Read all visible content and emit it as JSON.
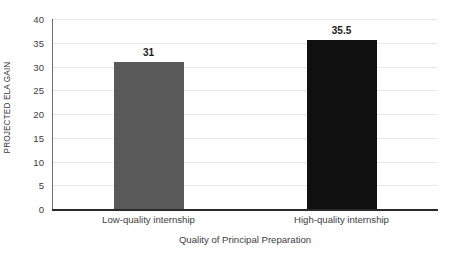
{
  "chart_data": {
    "type": "bar",
    "title": "",
    "subtitle": "",
    "categories": [
      "Low-quality internship",
      "High-quality internship"
    ],
    "values": [
      31,
      35.5
    ],
    "value_labels": [
      "31",
      "35.5"
    ],
    "bar_colors": [
      "#595959",
      "#101010"
    ],
    "xlabel": "Quality of Principal Preparation",
    "ylabel": "PROJECTED ELA GAIN",
    "ylim": [
      0,
      40
    ],
    "ytick_labels": [
      "0",
      "5",
      "10",
      "15",
      "20",
      "25",
      "30",
      "35",
      "40"
    ],
    "ytick_values": [
      0,
      5,
      10,
      15,
      20,
      25,
      30,
      35,
      40
    ],
    "grid": true,
    "grid_axis": "y",
    "grid_color": "#e8e8e8",
    "legend": false,
    "legend_position": "none",
    "axis_line_color": "#2a2a2a",
    "background_color": "#ffffff",
    "text_color": "#3d3d3d",
    "data_label_color": "#1a1a1a"
  }
}
